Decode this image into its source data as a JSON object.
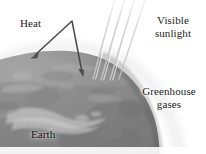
{
  "figure": {
    "width": 206,
    "height": 154,
    "background_color": "#ffffff"
  },
  "labels": {
    "heat": "Heat",
    "visible_sunlight_line1": "Visible",
    "visible_sunlight_line2": "sunlight",
    "greenhouse_gases_line1": "Greenhouse",
    "greenhouse_gases_line2": "gases",
    "earth": "Earth"
  },
  "colors": {
    "text": "#1b1b1b",
    "arrow_stroke": "#4a4a4a",
    "ray_stroke": "#cfcfcf",
    "earth_dark": "#5d5d5d",
    "earth_mid": "#8a8a8a",
    "earth_light": "#c9c9c9",
    "halo": "#ededed",
    "background": "#ffffff"
  },
  "elements": {
    "heat_arrow_name": "heat-arrow",
    "sunlight_rays_name": "sunlight-rays",
    "earth_sphere_name": "earth-sphere",
    "atmosphere_halo_name": "atmosphere-halo"
  }
}
